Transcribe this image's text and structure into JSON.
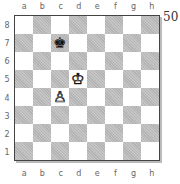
{
  "diagram": {
    "number": "50",
    "files": [
      "a",
      "b",
      "c",
      "d",
      "e",
      "f",
      "g",
      "h"
    ],
    "ranks": [
      "8",
      "7",
      "6",
      "5",
      "4",
      "3",
      "2",
      "1"
    ],
    "colors": {
      "light": "#ffffff",
      "dark": "#b3b3b3",
      "border": "#444444"
    },
    "pieces": [
      {
        "square": "c7",
        "piece": "king",
        "color": "black",
        "glyph": "♚"
      },
      {
        "square": "d5",
        "piece": "king",
        "color": "white",
        "glyph": "♔"
      },
      {
        "square": "c4",
        "piece": "pawn",
        "color": "white",
        "glyph": "♙"
      }
    ]
  }
}
